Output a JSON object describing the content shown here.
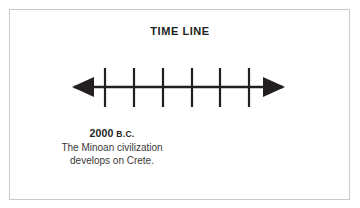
{
  "figure": {
    "title": "TIME LINE",
    "background_color": "#ffffff",
    "border_color": "#c9c9c9",
    "ink_color": "#231f20"
  },
  "timeline": {
    "axis_label": "time-axis",
    "left_arrow_icon": "left-arrowhead-icon",
    "right_arrow_icon": "right-arrowhead-icon",
    "tick_count": 6,
    "tick_positions": [
      45,
      74,
      103,
      132,
      160,
      189
    ],
    "tick_labels": [
      "",
      "",
      "",
      "",
      "",
      ""
    ],
    "axis_y": 27,
    "axis_start_x": 12,
    "axis_end_x": 225,
    "tick_top_y": 8,
    "tick_bottom_y": 47
  },
  "caption": {
    "date": "2000",
    "era": "B.C.",
    "lines": [
      "The Minoan civilization",
      "develops on Crete."
    ]
  }
}
